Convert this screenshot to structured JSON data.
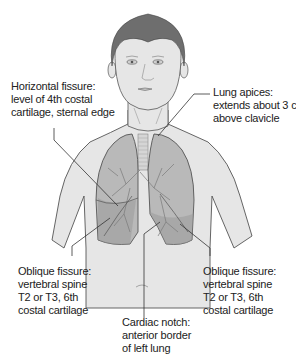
{
  "figure": {
    "colors": {
      "background": "#ffffff",
      "skin": "#e6e6e6",
      "outline": "#555555",
      "hair": "#6e6e6e",
      "lung": "#b9b9b9",
      "lung_dark": "#9a9a9a",
      "leader_line": "#333333",
      "text": "#222222"
    }
  },
  "labels": {
    "horizontal_fissure": {
      "lines": [
        "Horizontal fissure:",
        "level of 4th costal",
        "cartilage, sternal edge"
      ]
    },
    "lung_apices": {
      "lines": [
        "Lung apices:",
        "extends about 3 cm",
        "above clavicle"
      ]
    },
    "oblique_fissure_right": {
      "lines": [
        "Oblique fissure:",
        "vertebral spine",
        "T2 or T3, 6th",
        "costal cartilage"
      ]
    },
    "oblique_fissure_left": {
      "lines": [
        "Oblique fissure:",
        "vertebral spine",
        "T2 or T3, 6th",
        "costal cartilage"
      ]
    },
    "cardiac_notch": {
      "lines": [
        "Cardiac notch:",
        "anterior border",
        "of left lung"
      ]
    }
  }
}
